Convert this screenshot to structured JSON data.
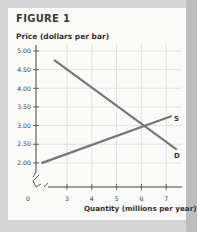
{
  "figure": {
    "title": "FIGURE 1"
  },
  "chart_data": {
    "type": "line",
    "title": "FIGURE 1",
    "ylabel": "Price (dollars per bar)",
    "xlabel": "Quantity (millions per year)",
    "y_ticks": [
      "5.00",
      "4.50",
      "4.00",
      "3.50",
      "3.00",
      "2.50",
      "2.00"
    ],
    "x_ticks": [
      "0",
      "3",
      "4",
      "5",
      "6",
      "7"
    ],
    "ylim": [
      2.0,
      5.0
    ],
    "xlim": [
      2,
      7.5
    ],
    "axis_breaks": true,
    "grid": true,
    "series": [
      {
        "name": "S",
        "label": "Supply",
        "points": [
          [
            2.0,
            2.0
          ],
          [
            7.2,
            3.25
          ]
        ],
        "color": "#777777"
      },
      {
        "name": "D",
        "label": "Demand",
        "points": [
          [
            2.5,
            4.75
          ],
          [
            7.4,
            2.37
          ]
        ],
        "color": "#777777"
      }
    ],
    "equilibrium": {
      "quantity": 6,
      "price": 3.0
    }
  },
  "labels": {
    "supply": "S",
    "demand": "D"
  }
}
